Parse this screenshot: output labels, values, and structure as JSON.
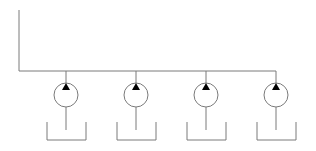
{
  "diagram": {
    "type": "hydraulic-schematic",
    "line_color": "#7a7a7a",
    "arrow_color": "#000000",
    "main_line": {
      "x_start": 19,
      "y_top": 10,
      "y_bus": 71,
      "x_end": 276
    },
    "pumps": [
      {
        "id": "pump-1",
        "cx": 66,
        "cy": 95,
        "r": 12,
        "tank": {
          "x1": 47,
          "x2": 86,
          "y_top": 122,
          "y_bottom": 140
        }
      },
      {
        "id": "pump-2",
        "cx": 136,
        "cy": 95,
        "r": 12,
        "tank": {
          "x1": 117,
          "x2": 156,
          "y_top": 122,
          "y_bottom": 140
        }
      },
      {
        "id": "pump-3",
        "cx": 206,
        "cy": 95,
        "r": 12,
        "tank": {
          "x1": 187,
          "x2": 226,
          "y_top": 122,
          "y_bottom": 140
        }
      },
      {
        "id": "pump-4",
        "cx": 276,
        "cy": 95,
        "r": 12,
        "tank": {
          "x1": 257,
          "x2": 296,
          "y_top": 122,
          "y_bottom": 140
        }
      }
    ]
  }
}
